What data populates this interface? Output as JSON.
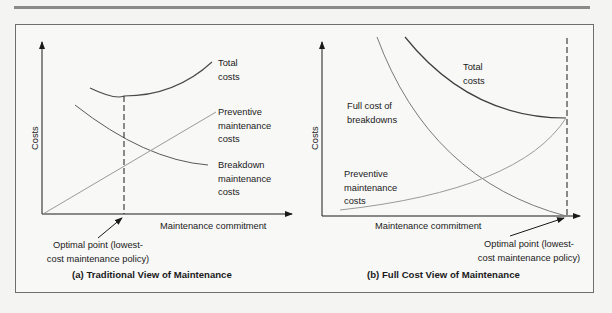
{
  "panel_a": {
    "caption": "(a) Traditional View of Maintenance",
    "y_axis_label": "Costs",
    "x_axis_label": "Maintenance commitment",
    "curve_labels": {
      "total_1": "Total",
      "total_2": "costs",
      "preventive_1": "Preventive",
      "preventive_2": "maintenance",
      "preventive_3": "costs",
      "breakdown_1": "Breakdown",
      "breakdown_2": "maintenance",
      "breakdown_3": "costs"
    },
    "optimal_1": "Optimal point (lowest-",
    "optimal_2": "cost maintenance policy)"
  },
  "panel_b": {
    "caption": "(b) Full Cost View of Maintenance",
    "y_axis_label": "Costs",
    "x_axis_label": "Maintenance commitment",
    "curve_labels": {
      "total_1": "Total",
      "total_2": "costs",
      "breakdown_1": "Full cost of",
      "breakdown_2": "breakdowns",
      "preventive_1": "Preventive",
      "preventive_2": "maintenance",
      "preventive_3": "costs"
    },
    "optimal_1": "Optimal point (lowest-",
    "optimal_2": "cost maintenance policy)"
  },
  "colors": {
    "dark_curve": "#4a4a4a",
    "light_curve": "#9a9a9a",
    "axis": "#1a1a1a"
  }
}
